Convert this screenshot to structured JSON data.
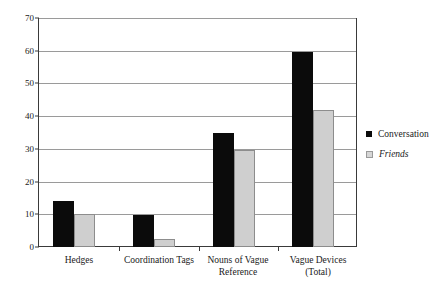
{
  "chart_data": {
    "type": "bar",
    "title": "",
    "subtitle": "",
    "xlabel": "",
    "ylabel": "",
    "ylim": [
      0,
      70
    ],
    "ytick_step": 10,
    "yticks": [
      0,
      10,
      20,
      30,
      40,
      50,
      60,
      70
    ],
    "ytick_labels": [
      "0",
      "10",
      "20",
      "30",
      "40",
      "50",
      "60",
      "70"
    ],
    "grid": true,
    "grid_axis": "y",
    "legend_position": "right",
    "categories": [
      "Hedges",
      "Coordination Tags",
      "Nouns of Vague Reference",
      "Vague Devices (Total)"
    ],
    "category_lines": [
      [
        "Hedges"
      ],
      [
        "Coordination Tags"
      ],
      [
        "Nouns of Vague",
        "Reference"
      ],
      [
        "Vague Devices",
        "(Total)"
      ]
    ],
    "series": [
      {
        "name": "Conversation",
        "color": "#0b0b0b",
        "italic": false,
        "values": [
          14,
          9.8,
          35,
          59.7
        ]
      },
      {
        "name": "Friends",
        "color": "#cfcfcf",
        "italic": true,
        "values": [
          10,
          2.3,
          29.7,
          41.9
        ]
      }
    ]
  },
  "legend": {
    "items": [
      {
        "label": "Conversation"
      },
      {
        "label": "Friends"
      }
    ]
  },
  "colors": {
    "background": "#ffffff",
    "gridline": "#9a9a9a",
    "axis": "#3a3a3a",
    "series_conversation": "#0b0b0b",
    "series_friends": "#cfcfcf",
    "series_friends_border": "#8d8d8d",
    "text": "#1a1a1a"
  }
}
